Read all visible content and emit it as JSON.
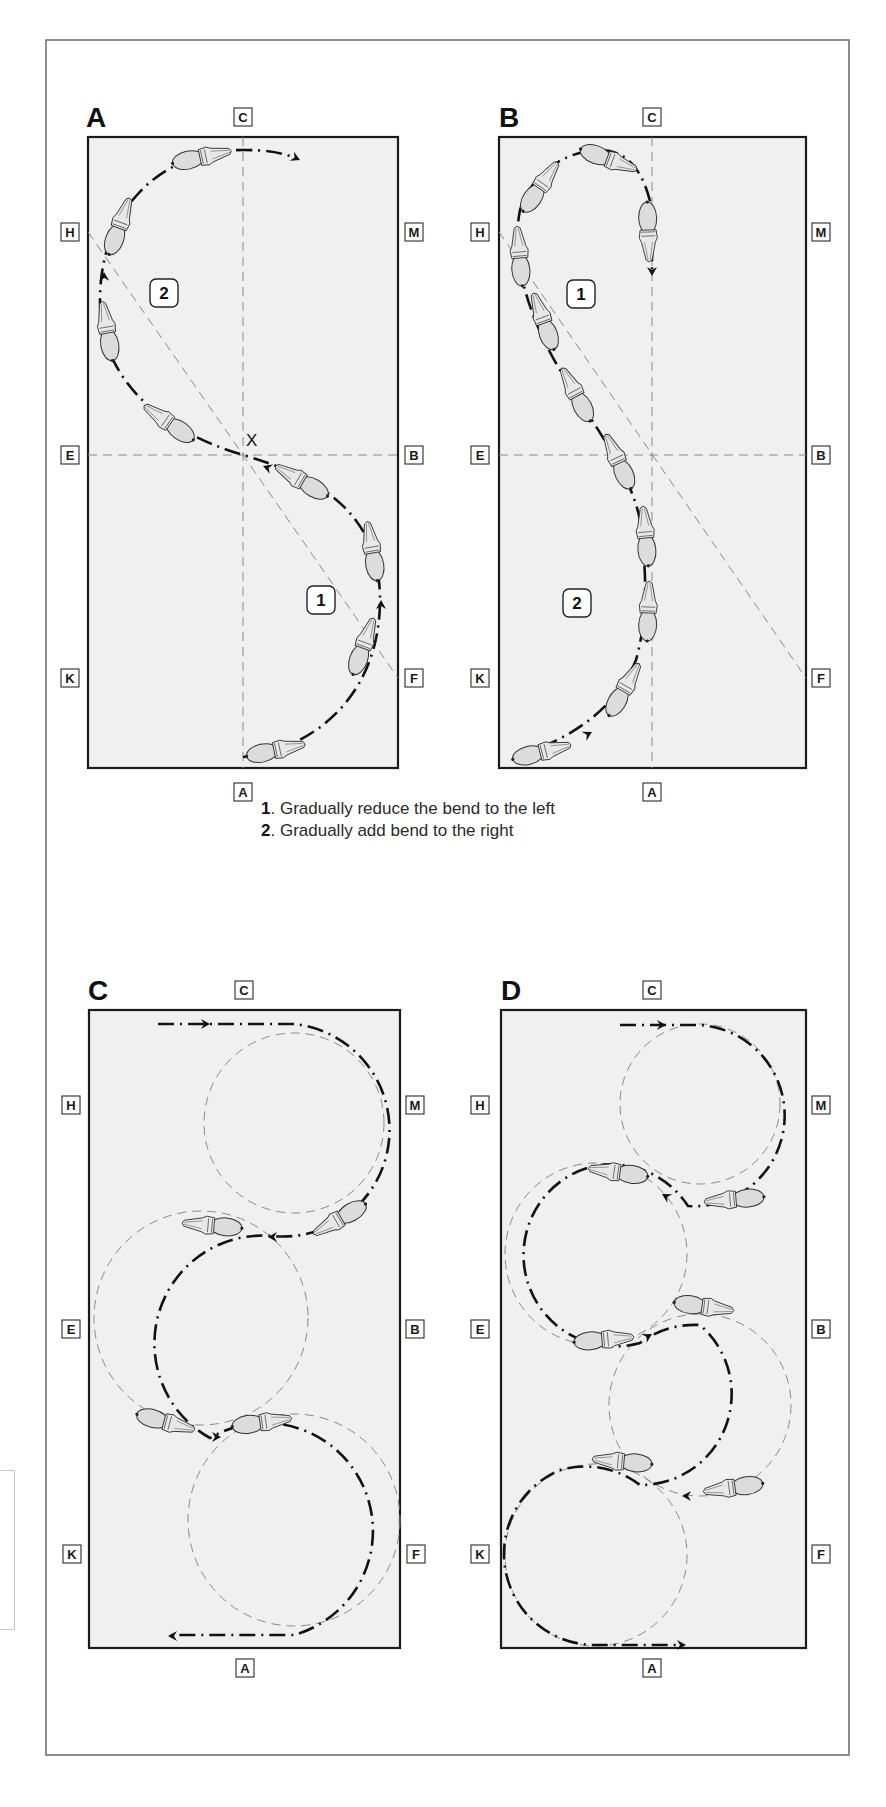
{
  "figure": {
    "panels": [
      {
        "id": "A",
        "label": "A",
        "pattern": "serpentine-change-of-rein-through-X",
        "markers": {
          "top": "C",
          "bottom": "A",
          "left": [
            "H",
            "E",
            "K"
          ],
          "right": [
            "M",
            "B",
            "F"
          ]
        },
        "center_label": "X",
        "numbered_zones": [
          {
            "number": "2",
            "position": "upper-left"
          },
          {
            "number": "1",
            "position": "lower-right"
          }
        ]
      },
      {
        "id": "B",
        "label": "B",
        "pattern": "half-circle-and-return-change-of-rein",
        "markers": {
          "top": "C",
          "bottom": "A",
          "left": [
            "H",
            "E",
            "K"
          ],
          "right": [
            "M",
            "B",
            "F"
          ]
        },
        "numbered_zones": [
          {
            "number": "1",
            "position": "upper"
          },
          {
            "number": "2",
            "position": "lower"
          }
        ]
      },
      {
        "id": "C",
        "label": "C",
        "pattern": "three-linked-circles-centre-line",
        "markers": {
          "top": "C",
          "bottom": "A",
          "left": [
            "H",
            "E",
            "K"
          ],
          "right": [
            "M",
            "B",
            "F"
          ]
        }
      },
      {
        "id": "D",
        "label": "D",
        "pattern": "four-linked-circles-serpentine",
        "markers": {
          "top": "C",
          "bottom": "A",
          "left": [
            "H",
            "E",
            "K"
          ],
          "right": [
            "M",
            "B",
            "F"
          ]
        }
      }
    ],
    "caption": [
      {
        "number": "1",
        "text": ". Gradually reduce the bend to the left"
      },
      {
        "number": "2",
        "text": ". Gradually add bend to the right"
      }
    ],
    "icons": [
      "horse-top-view-icon",
      "direction-arrow-icon"
    ]
  }
}
